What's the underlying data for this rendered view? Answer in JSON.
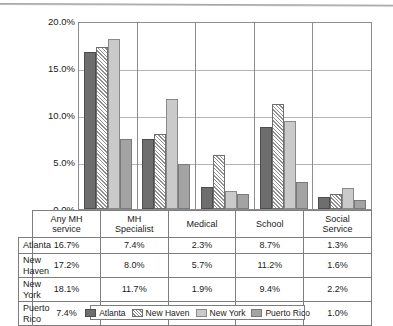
{
  "chart_data": {
    "type": "bar",
    "title": "",
    "xlabel": "",
    "ylabel": "",
    "ylim": [
      0,
      20
    ],
    "grid": true,
    "legend_position": "bottom",
    "categories": [
      "Any MH service",
      "MH Specialist",
      "Medical",
      "School",
      "Social Service"
    ],
    "series": [
      {
        "name": "Atlanta",
        "values": [
          16.7,
          7.4,
          2.3,
          8.7,
          1.3
        ],
        "color": "#6e6e6e",
        "pattern": "solid-dark-gray"
      },
      {
        "name": "New Haven",
        "values": [
          17.2,
          8.0,
          5.7,
          11.2,
          1.6
        ],
        "color": "#ffffff",
        "pattern": "diagonal-hatch"
      },
      {
        "name": "New York",
        "values": [
          18.1,
          11.7,
          1.9,
          9.4,
          2.2
        ],
        "color": "#cacaca",
        "pattern": "solid-light-gray"
      },
      {
        "name": "Puerto Rico",
        "values": [
          7.4,
          4.8,
          1.6,
          2.9,
          1.0
        ],
        "color": "#a3a3a3",
        "pattern": "solid-medium-gray"
      }
    ],
    "yticks": [
      {
        "value": 20,
        "label": "20.0%"
      },
      {
        "value": 15,
        "label": "15.0%"
      },
      {
        "value": 10,
        "label": "10.0%"
      },
      {
        "value": 5,
        "label": "5.0%"
      },
      {
        "value": 0,
        "label": "0.0%"
      }
    ],
    "category_labels_multiline": [
      [
        "Any MH",
        "service"
      ],
      [
        "MH",
        "Specialist"
      ],
      [
        "Medical",
        ""
      ],
      [
        "School",
        ""
      ],
      [
        "Social",
        "Service"
      ]
    ]
  },
  "table": {
    "header": [
      "Any MH service",
      "MH Specialist",
      "Medical",
      "School",
      "Social Service"
    ],
    "rows": [
      {
        "label": "Atlanta",
        "cells": [
          "16.7%",
          "7.4%",
          "2.3%",
          "8.7%",
          "1.3%"
        ]
      },
      {
        "label": "New Haven",
        "cells": [
          "17.2%",
          "8.0%",
          "5.7%",
          "11.2%",
          "1.6%"
        ]
      },
      {
        "label": "New York",
        "cells": [
          "18.1%",
          "11.7%",
          "1.9%",
          "9.4%",
          "2.2%"
        ]
      },
      {
        "label": "Puerto Rico",
        "cells": [
          "7.4%",
          "4.8%",
          "1.6%",
          "2.9%",
          "1.0%"
        ]
      }
    ]
  },
  "legend": {
    "items": [
      {
        "label": "Atlanta"
      },
      {
        "label": "New Haven"
      },
      {
        "label": "New York"
      },
      {
        "label": "Puerto Rico"
      }
    ]
  }
}
